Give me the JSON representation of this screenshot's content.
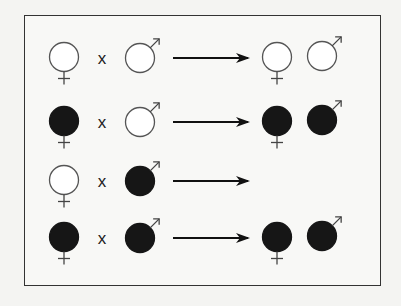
{
  "diagram": {
    "type": "genetic-cross",
    "cross_symbol": "x",
    "colors": {
      "filled": "#161616",
      "stroke": "#555555",
      "empty": "#ffffff",
      "arrow": "#111111"
    },
    "rows": [
      {
        "female_parent": "empty",
        "male_parent": "empty",
        "offspring": [
          {
            "sex": "female",
            "fill": "empty"
          },
          {
            "sex": "male",
            "fill": "empty"
          }
        ]
      },
      {
        "female_parent": "filled",
        "male_parent": "empty",
        "offspring": [
          {
            "sex": "female",
            "fill": "filled"
          },
          {
            "sex": "male",
            "fill": "filled"
          }
        ]
      },
      {
        "female_parent": "empty",
        "male_parent": "filled",
        "offspring": []
      },
      {
        "female_parent": "filled",
        "male_parent": "filled",
        "offspring": [
          {
            "sex": "female",
            "fill": "filled"
          },
          {
            "sex": "male",
            "fill": "filled"
          }
        ]
      }
    ]
  }
}
